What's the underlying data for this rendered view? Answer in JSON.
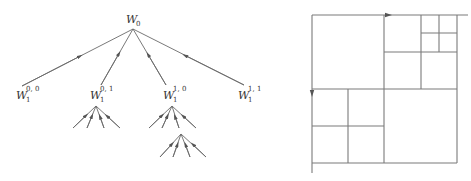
{
  "tree": {
    "root": {
      "label": "W",
      "sub": "0",
      "sup": ""
    },
    "children": [
      {
        "label": "W",
        "sub": "1",
        "sup": "0, 0"
      },
      {
        "label": "W",
        "sub": "1",
        "sup": "0, 1"
      },
      {
        "label": "W",
        "sub": "1",
        "sup": "1, 0"
      },
      {
        "label": "W",
        "sub": "1",
        "sup": "1, 1"
      }
    ]
  },
  "colors": {
    "line": "#6a6a6a",
    "arrow": "#555555",
    "background": "#ffffff"
  }
}
